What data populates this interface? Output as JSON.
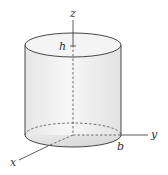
{
  "figure": {
    "type": "cylinder-3d-axes",
    "labels": {
      "z_axis": "z",
      "y_axis": "y",
      "x_axis": "x",
      "height": "h",
      "radius": "b"
    },
    "colors": {
      "stroke": "#333333",
      "fill_light": "#f2f2f2",
      "fill_dark": "#d9d9d9"
    }
  }
}
